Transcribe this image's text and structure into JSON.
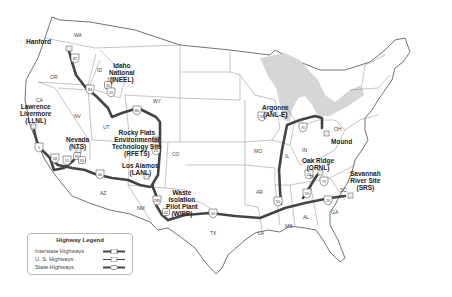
{
  "sites": [
    {
      "id": "hanford",
      "label": "Hanford",
      "x": 26,
      "y": 38
    },
    {
      "id": "inel",
      "label": "Idaho\nNational\n(INEEL)",
      "x": 109,
      "y": 62
    },
    {
      "id": "llnl",
      "label": "Lawrence\nLivermore\n(LLNL)",
      "x": 20,
      "y": 103
    },
    {
      "id": "nts",
      "label": "Nevada\n(NTS)",
      "x": 66,
      "y": 136
    },
    {
      "id": "rfets",
      "label": "Rocky Flats\nEnvironmental\nTechnology Site\n(RFETS)",
      "x": 112,
      "y": 129
    },
    {
      "id": "lanl",
      "label": "Los Alamos\n(LANL)",
      "x": 122,
      "y": 162
    },
    {
      "id": "wipp",
      "label": "Waste\nIsolation\nPilot Plant\n(WIPP)",
      "x": 166,
      "y": 189
    },
    {
      "id": "anl",
      "label": "Argonne\n(ANL-E)",
      "x": 262,
      "y": 104
    },
    {
      "id": "mound",
      "label": "Mound",
      "x": 331,
      "y": 138
    },
    {
      "id": "ornl",
      "label": "Oak Ridge\n(ORNL)",
      "x": 302,
      "y": 157
    },
    {
      "id": "srs",
      "label": "Savannah\nRiver Site\n(SRS)",
      "x": 350,
      "y": 170
    }
  ],
  "states": [
    {
      "label": "WA",
      "x": 74,
      "y": 32
    },
    {
      "label": "OR",
      "x": 50,
      "y": 74
    },
    {
      "label": "CA",
      "x": 36,
      "y": 97
    },
    {
      "label": "ID",
      "x": 97,
      "y": 67
    },
    {
      "label": "NV",
      "x": 74,
      "y": 113
    },
    {
      "label": "UT",
      "x": 103,
      "y": 124
    },
    {
      "label": "WY",
      "x": 153,
      "y": 98
    },
    {
      "label": "CO",
      "x": 172,
      "y": 151
    },
    {
      "label": "AZ",
      "x": 100,
      "y": 190
    },
    {
      "label": "NM",
      "x": 137,
      "y": 205
    },
    {
      "label": "TX",
      "x": 210,
      "y": 230
    },
    {
      "label": "MO",
      "x": 254,
      "y": 148
    },
    {
      "label": "IL",
      "x": 285,
      "y": 153
    },
    {
      "label": "IN",
      "x": 302,
      "y": 147
    },
    {
      "label": "OH",
      "x": 334,
      "y": 126
    },
    {
      "label": "AR",
      "x": 256,
      "y": 189
    },
    {
      "label": "LA",
      "x": 258,
      "y": 230
    },
    {
      "label": "MS",
      "x": 285,
      "y": 223
    },
    {
      "label": "AL",
      "x": 303,
      "y": 214
    },
    {
      "label": "GA",
      "x": 331,
      "y": 209
    },
    {
      "label": "SC",
      "x": 340,
      "y": 187
    },
    {
      "label": "TN",
      "x": 309,
      "y": 174
    }
  ],
  "shields": [
    {
      "type": "interstate",
      "number": "82",
      "x": 75,
      "y": 58
    },
    {
      "type": "interstate",
      "number": "84",
      "x": 90,
      "y": 89
    },
    {
      "type": "us",
      "number": "20",
      "x": 108,
      "y": 85
    },
    {
      "type": "interstate",
      "number": "15",
      "x": 111,
      "y": 92
    },
    {
      "type": "interstate",
      "number": "80",
      "x": 137,
      "y": 110
    },
    {
      "type": "interstate",
      "number": "25",
      "x": 156,
      "y": 150
    },
    {
      "type": "interstate",
      "number": "5",
      "x": 39,
      "y": 147
    },
    {
      "type": "interstate",
      "number": "15",
      "x": 67,
      "y": 160
    },
    {
      "type": "us",
      "number": "95",
      "x": 77,
      "y": 156
    },
    {
      "type": "interstate",
      "number": "58",
      "x": 55,
      "y": 158
    },
    {
      "type": "interstate",
      "number": "40",
      "x": 100,
      "y": 174
    },
    {
      "type": "us",
      "number": "93",
      "x": 82,
      "y": 160
    },
    {
      "type": "interstate",
      "number": "285",
      "x": 157,
      "y": 200
    },
    {
      "type": "us",
      "number": "62",
      "x": 166,
      "y": 212
    },
    {
      "type": "interstate",
      "number": "20",
      "x": 213,
      "y": 213
    },
    {
      "type": "interstate",
      "number": "55",
      "x": 262,
      "y": 116
    },
    {
      "type": "interstate",
      "number": "70",
      "x": 303,
      "y": 127
    },
    {
      "type": "interstate",
      "number": "24",
      "x": 309,
      "y": 174
    },
    {
      "type": "interstate",
      "number": "75",
      "x": 324,
      "y": 181
    },
    {
      "type": "interstate",
      "number": "59",
      "x": 307,
      "y": 193
    },
    {
      "type": "interstate",
      "number": "20",
      "x": 328,
      "y": 200
    },
    {
      "type": "interstate",
      "number": "55",
      "x": 278,
      "y": 201
    }
  ],
  "legend": {
    "title": "Highway Legend",
    "items": [
      {
        "label": "Interstate Highways",
        "type": "interstate"
      },
      {
        "label": "U. S. Highways",
        "type": "us"
      },
      {
        "label": "State Highways",
        "type": "state"
      }
    ]
  },
  "colors": {
    "route": "#444444",
    "border": "#888888",
    "lakes": "#d6d6d6",
    "text": "#222222"
  }
}
